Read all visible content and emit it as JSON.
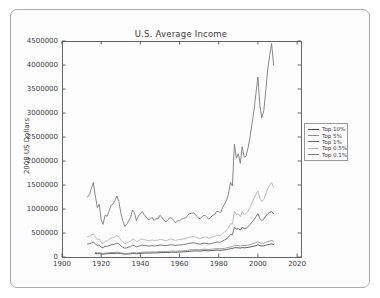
{
  "figure": {
    "kind": "matplotlib-line-chart-screenshot",
    "background_color": "#fdfdfd",
    "frame_border_color": "#a9a9a9",
    "axes_color": "#555555",
    "text_color": "#3a3a3a"
  },
  "chart_data": {
    "type": "line",
    "title": "U.S. Average Income",
    "xlabel": "",
    "ylabel": "2008 US Dollars",
    "xlim": [
      1900,
      2022
    ],
    "ylim": [
      0,
      4500000
    ],
    "x_ticks": [
      1900,
      1920,
      1940,
      1960,
      1980,
      2000,
      2020
    ],
    "y_ticks": [
      0,
      500000,
      1000000,
      1500000,
      2000000,
      2500000,
      3000000,
      3500000,
      4000000,
      4500000
    ],
    "grid": false,
    "legend_position": "outside-right",
    "series": [
      {
        "name": "Top 10%",
        "color": "#474747",
        "start_year": 1917,
        "values": [
          75000,
          68000,
          72000,
          64000,
          60000,
          65000,
          68000,
          70000,
          73000,
          74000,
          76000,
          80000,
          78000,
          70000,
          65000,
          60000,
          61000,
          64000,
          67000,
          73000,
          72000,
          67000,
          72000,
          75000,
          80000,
          81000,
          83000,
          84000,
          84000,
          86000,
          85000,
          87000,
          87000,
          92000,
          92000,
          92000,
          93000,
          94000,
          98000,
          100000,
          99000,
          97000,
          102000,
          103000,
          105000,
          108000,
          110000,
          115000,
          119000,
          122000,
          125000,
          127000,
          126000,
          125000,
          126000,
          131000,
          134000,
          130000,
          127000,
          131000,
          135000,
          140000,
          143000,
          141000,
          140000,
          144000,
          149000,
          155000,
          162000,
          172000,
          173000,
          196000,
          192000,
          192000,
          186000,
          196000,
          192000,
          194000,
          200000,
          208000,
          218000,
          228000,
          238000,
          255000,
          238000,
          230000,
          234000,
          246000,
          257000,
          265000,
          272000,
          260000
        ]
      },
      {
        "name": "Top 5%",
        "color": "#909090",
        "start_year": 1917,
        "values": [
          95000,
          85000,
          90000,
          80000,
          75000,
          82000,
          85000,
          88000,
          92000,
          93000,
          95000,
          100000,
          98000,
          88000,
          82000,
          75000,
          76000,
          80000,
          84000,
          92000,
          90000,
          84000,
          90000,
          94000,
          100000,
          100000,
          102000,
          103000,
          103000,
          106000,
          104000,
          106000,
          106000,
          112000,
          112000,
          112000,
          113000,
          114000,
          120000,
          122000,
          121000,
          118000,
          124000,
          125000,
          128000,
          131000,
          134000,
          140000,
          145000,
          149000,
          152000,
          155000,
          154000,
          152000,
          153000,
          160000,
          163000,
          158000,
          155000,
          160000,
          165000,
          171000,
          175000,
          172000,
          171000,
          176000,
          182000,
          190000,
          198000,
          210000,
          212000,
          245000,
          238000,
          240000,
          230000,
          242000,
          236000,
          240000,
          248000,
          258000,
          272000,
          285000,
          298000,
          318000,
          295000,
          285000,
          290000,
          305000,
          320000,
          332000,
          345000,
          330000
        ]
      },
      {
        "name": "Top 1%",
        "color": "#686868",
        "start_year": 1913,
        "values": [
          270000,
          275000,
          295000,
          310000,
          275000,
          240000,
          250000,
          205000,
          190000,
          220000,
          220000,
          235000,
          255000,
          260000,
          270000,
          290000,
          275000,
          230000,
          205000,
          185000,
          190000,
          205000,
          215000,
          245000,
          235000,
          210000,
          225000,
          235000,
          250000,
          240000,
          235000,
          230000,
          230000,
          240000,
          230000,
          235000,
          235000,
          250000,
          245000,
          240000,
          235000,
          240000,
          255000,
          255000,
          250000,
          240000,
          250000,
          250000,
          255000,
          260000,
          265000,
          275000,
          285000,
          290000,
          295000,
          290000,
          280000,
          270000,
          270000,
          285000,
          290000,
          280000,
          270000,
          280000,
          290000,
          300000,
          310000,
          310000,
          310000,
          335000,
          355000,
          380000,
          415000,
          470000,
          460000,
          620000,
          580000,
          590000,
          560000,
          620000,
          590000,
          600000,
          630000,
          680000,
          730000,
          780000,
          840000,
          900000,
          800000,
          760000,
          790000,
          850000,
          900000,
          930000,
          950000,
          900000
        ]
      },
      {
        "name": "Top 0.5%",
        "color": "#b3b3b3",
        "start_year": 1913,
        "values": [
          420000,
          430000,
          460000,
          480000,
          420000,
          360000,
          380000,
          300000,
          280000,
          330000,
          330000,
          360000,
          390000,
          400000,
          420000,
          450000,
          420000,
          350000,
          310000,
          280000,
          290000,
          310000,
          330000,
          380000,
          360000,
          320000,
          340000,
          360000,
          380000,
          360000,
          350000,
          340000,
          340000,
          360000,
          340000,
          350000,
          350000,
          370000,
          360000,
          350000,
          340000,
          350000,
          370000,
          370000,
          360000,
          340000,
          360000,
          360000,
          370000,
          380000,
          380000,
          400000,
          410000,
          420000,
          430000,
          420000,
          400000,
          390000,
          390000,
          410000,
          420000,
          400000,
          390000,
          400000,
          420000,
          430000,
          450000,
          450000,
          450000,
          490000,
          520000,
          560000,
          610000,
          700000,
          680000,
          950000,
          880000,
          900000,
          840000,
          950000,
          890000,
          900000,
          960000,
          1040000,
          1130000,
          1220000,
          1300000,
          1380000,
          1230000,
          1150000,
          1200000,
          1310000,
          1420000,
          1500000,
          1550000,
          1450000
        ]
      },
      {
        "name": "Top 0.1%",
        "color": "#7a7a7a",
        "start_year": 1913,
        "values": [
          1250000,
          1300000,
          1430000,
          1550000,
          1280000,
          1030000,
          1100000,
          780000,
          680000,
          870000,
          850000,
          950000,
          1080000,
          1100000,
          1180000,
          1270000,
          1160000,
          920000,
          760000,
          640000,
          680000,
          750000,
          830000,
          980000,
          920000,
          760000,
          850000,
          900000,
          950000,
          880000,
          830000,
          780000,
          790000,
          830000,
          760000,
          800000,
          790000,
          870000,
          820000,
          770000,
          730000,
          770000,
          820000,
          810000,
          760000,
          710000,
          760000,
          750000,
          790000,
          800000,
          810000,
          860000,
          900000,
          910000,
          920000,
          890000,
          840000,
          800000,
          810000,
          860000,
          870000,
          820000,
          790000,
          830000,
          870000,
          890000,
          950000,
          940000,
          930000,
          1030000,
          1100000,
          1190000,
          1310000,
          1560000,
          1480000,
          2350000,
          2060000,
          2150000,
          1950000,
          2300000,
          2080000,
          2100000,
          2280000,
          2500000,
          2780000,
          3060000,
          3400000,
          3750000,
          3150000,
          2900000,
          3050000,
          3450000,
          3900000,
          4200000,
          4450000,
          4000000
        ]
      }
    ]
  }
}
